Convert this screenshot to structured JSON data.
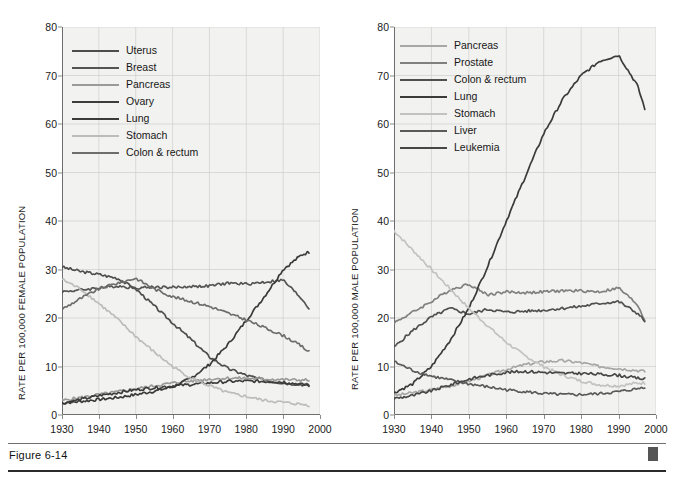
{
  "figure": {
    "caption": "Figure 6-14",
    "marker_icon": "square-marker"
  },
  "chart_data": [
    {
      "type": "line",
      "id": "female",
      "title": "",
      "xlabel": "",
      "ylabel": "RATE PER 100,000 FEMALE POPULATION",
      "xlim": [
        1930,
        2000
      ],
      "ylim": [
        0,
        80
      ],
      "xticks": [
        1930,
        1940,
        1950,
        1960,
        1970,
        1980,
        1990,
        2000
      ],
      "yticks": [
        0,
        10,
        20,
        30,
        40,
        50,
        60,
        70,
        80
      ],
      "grid": true,
      "legend_position": "top-left",
      "x": [
        1930,
        1935,
        1940,
        1945,
        1950,
        1955,
        1960,
        1965,
        1970,
        1975,
        1980,
        1985,
        1990,
        1995,
        1997
      ],
      "series": [
        {
          "name": "Uterus",
          "color": "#4d4d4d",
          "values": [
            30.5,
            29.6,
            29.0,
            28.2,
            26.0,
            22.5,
            19.0,
            15.6,
            12.0,
            9.6,
            8.2,
            7.2,
            6.6,
            6.3,
            6.2
          ]
        },
        {
          "name": "Breast",
          "color": "#545454",
          "values": [
            25.4,
            25.8,
            26.2,
            26.6,
            26.2,
            26.4,
            26.3,
            26.5,
            26.6,
            27.2,
            27.0,
            27.4,
            27.8,
            24.0,
            22.0
          ]
        },
        {
          "name": "Pancreas",
          "color": "#9a9a9a",
          "values": [
            3.0,
            3.6,
            4.2,
            4.8,
            5.4,
            6.0,
            6.6,
            7.0,
            7.4,
            7.6,
            7.6,
            7.4,
            7.3,
            7.2,
            7.2
          ]
        },
        {
          "name": "Ovary",
          "color": "#3c3c3c",
          "values": [
            2.4,
            3.2,
            4.0,
            4.6,
            5.2,
            5.6,
            6.0,
            6.3,
            6.6,
            6.9,
            7.0,
            6.9,
            6.8,
            6.3,
            6.1
          ]
        },
        {
          "name": "Lung",
          "color": "#3a3a3a",
          "values": [
            2.5,
            2.8,
            3.2,
            3.6,
            4.2,
            4.9,
            5.8,
            7.6,
            10.4,
            14.5,
            19.5,
            24.5,
            30.0,
            33.0,
            33.6
          ]
        },
        {
          "name": "Stomach",
          "color": "#bcbcbc",
          "values": [
            28.0,
            26.0,
            23.0,
            19.8,
            16.2,
            13.0,
            10.0,
            7.6,
            6.0,
            4.6,
            3.8,
            3.0,
            2.6,
            2.2,
            2.0
          ]
        },
        {
          "name": "Colon & rectum",
          "color": "#6d6d6d",
          "values": [
            21.8,
            24.0,
            26.0,
            27.2,
            28.2,
            26.0,
            24.4,
            23.4,
            22.4,
            21.0,
            19.6,
            18.0,
            16.4,
            14.2,
            13.0
          ]
        }
      ]
    },
    {
      "type": "line",
      "id": "male",
      "title": "",
      "xlabel": "",
      "ylabel": "RATE PER 100,000 MALE POPULATION",
      "xlim": [
        1930,
        2000
      ],
      "ylim": [
        0,
        80
      ],
      "xticks": [
        1930,
        1940,
        1950,
        1960,
        1970,
        1980,
        1990,
        2000
      ],
      "yticks": [
        0,
        10,
        20,
        30,
        40,
        50,
        60,
        70,
        80
      ],
      "grid": true,
      "legend_position": "top-left",
      "x": [
        1930,
        1935,
        1940,
        1945,
        1950,
        1955,
        1960,
        1965,
        1970,
        1975,
        1980,
        1985,
        1990,
        1995,
        1997
      ],
      "series": [
        {
          "name": "Pancreas",
          "color": "#a7a7a7",
          "values": [
            4.0,
            4.6,
            5.2,
            6.0,
            7.0,
            8.2,
            9.4,
            10.4,
            11.0,
            11.2,
            10.8,
            10.0,
            9.6,
            9.2,
            9.0
          ]
        },
        {
          "name": "Prostate",
          "color": "#808080",
          "values": [
            19.0,
            21.2,
            23.4,
            25.8,
            27.0,
            24.8,
            25.4,
            25.2,
            25.4,
            25.6,
            25.6,
            25.4,
            26.2,
            22.8,
            19.6
          ]
        },
        {
          "name": "Colon & rectum",
          "color": "#4f4f4f",
          "values": [
            14.0,
            17.4,
            20.2,
            22.0,
            20.8,
            21.8,
            21.2,
            21.4,
            21.6,
            22.0,
            22.4,
            23.0,
            23.4,
            21.0,
            19.4
          ]
        },
        {
          "name": "Lung",
          "color": "#3b3b3b",
          "values": [
            4.6,
            6.4,
            10.0,
            15.4,
            22.0,
            30.6,
            40.0,
            49.0,
            58.0,
            65.0,
            70.0,
            73.0,
            74.2,
            68.0,
            63.2
          ]
        },
        {
          "name": "Stomach",
          "color": "#c2c2c2",
          "values": [
            38.0,
            34.0,
            30.0,
            26.0,
            22.0,
            18.4,
            15.0,
            12.2,
            10.0,
            8.2,
            7.0,
            6.2,
            6.0,
            6.6,
            6.6
          ]
        },
        {
          "name": "Liver",
          "color": "#5a5a5a",
          "values": [
            11.0,
            9.2,
            8.0,
            7.2,
            6.4,
            5.8,
            5.2,
            4.8,
            4.4,
            4.2,
            4.2,
            4.4,
            4.8,
            5.4,
            5.8
          ]
        },
        {
          "name": "Leukemia",
          "color": "#474747",
          "values": [
            3.4,
            4.0,
            5.0,
            6.2,
            7.4,
            8.2,
            8.8,
            9.0,
            8.8,
            8.6,
            8.6,
            8.4,
            8.2,
            7.6,
            7.4
          ]
        }
      ]
    }
  ]
}
